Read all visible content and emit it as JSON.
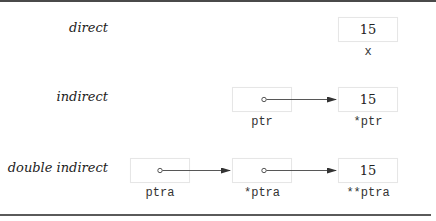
{
  "diagram": {
    "rows": [
      {
        "label": "direct",
        "cells": [
          {
            "value": "15",
            "name": "x",
            "kind": "value"
          }
        ]
      },
      {
        "label": "indirect",
        "cells": [
          {
            "value": "",
            "name": "ptr",
            "kind": "pointer"
          },
          {
            "value": "15",
            "name": "*ptr",
            "kind": "value"
          }
        ]
      },
      {
        "label": "double indirect",
        "cells": [
          {
            "value": "",
            "name": "ptra",
            "kind": "pointer"
          },
          {
            "value": "",
            "name": "*ptra",
            "kind": "pointer"
          },
          {
            "value": "15",
            "name": "**ptra",
            "kind": "value"
          }
        ]
      }
    ],
    "colors": {
      "frame": "#4a4a4a",
      "box_border": "#e6e6e6",
      "arrow": "#333333",
      "text": "#222222"
    }
  }
}
